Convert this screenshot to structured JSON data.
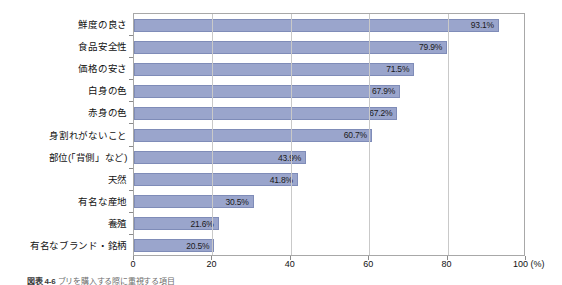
{
  "chart_data": {
    "type": "bar",
    "orientation": "horizontal",
    "title": "",
    "xlabel": "(%)",
    "ylabel": "",
    "xlim": [
      0,
      100
    ],
    "xticks": [
      "0",
      "20",
      "40",
      "60",
      "80",
      "100 (%)"
    ],
    "xtick_values": [
      0,
      20,
      40,
      60,
      80,
      100
    ],
    "grid": "vertical",
    "legend": "none",
    "categories": [
      "鮮度の良さ",
      "食品安全性",
      "価格の安さ",
      "白身の色",
      "赤身の色",
      "身割れがないこと",
      "部位(「背側」など)",
      "天然",
      "有名な産地",
      "養殖",
      "有名なブランド・銘柄"
    ],
    "values": [
      93.1,
      79.9,
      71.5,
      67.9,
      67.2,
      60.7,
      43.9,
      41.8,
      30.5,
      21.6,
      20.5
    ],
    "value_labels": [
      "93.1%",
      "79.9%",
      "71.5%",
      "67.9%",
      "67.2%",
      "60.7%",
      "43.9%",
      "41.8%",
      "30.5%",
      "21.6%",
      "20.5%"
    ],
    "bar_color": "#9aa5cc",
    "bar_border_color": "#7f8cb8",
    "grid_color": "#c9c9c9",
    "frame_color": "#a8a8a8"
  },
  "caption": {
    "prefix": "図表 4-6",
    "text": "ブリを購入する際に重視する項目"
  }
}
